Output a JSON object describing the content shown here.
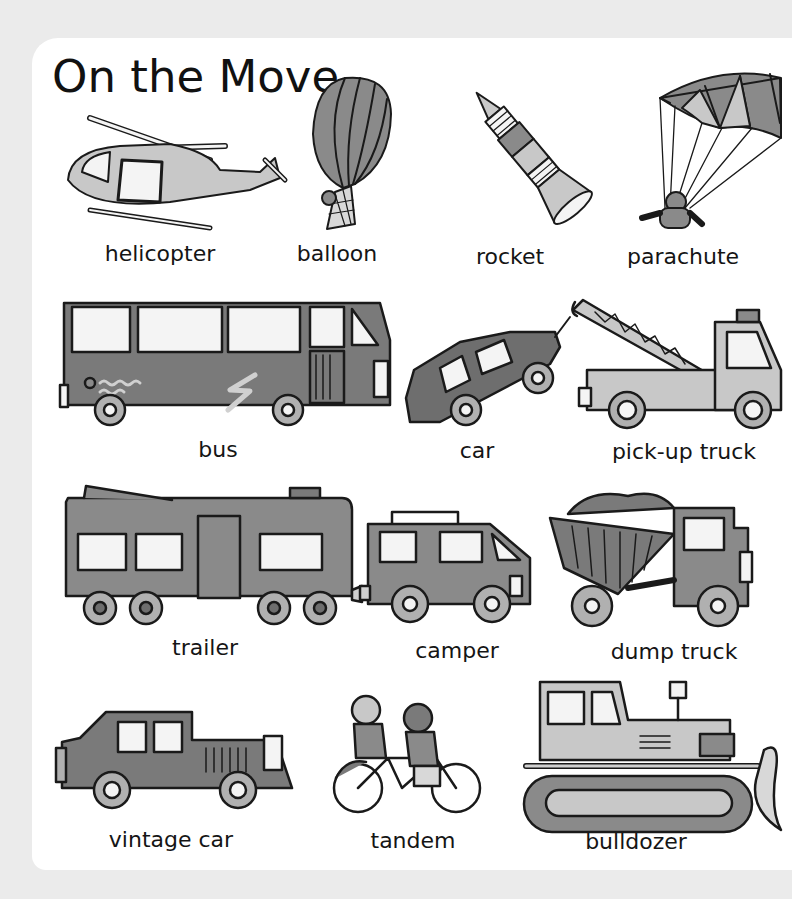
{
  "page": {
    "title": "On the Move"
  },
  "vehicles": [
    {
      "id": "helicopter",
      "label": "helicopter",
      "row": 1
    },
    {
      "id": "balloon",
      "label": "balloon",
      "row": 1
    },
    {
      "id": "rocket",
      "label": "rocket",
      "row": 1
    },
    {
      "id": "parachute",
      "label": "parachute",
      "row": 1
    },
    {
      "id": "bus",
      "label": "bus",
      "row": 2
    },
    {
      "id": "car",
      "label": "car",
      "row": 2
    },
    {
      "id": "pickup-truck",
      "label": "pick-up truck",
      "row": 2
    },
    {
      "id": "trailer",
      "label": "trailer",
      "row": 3
    },
    {
      "id": "camper",
      "label": "camper",
      "row": 3
    },
    {
      "id": "dump-truck",
      "label": "dump truck",
      "row": 3
    },
    {
      "id": "vintage-car",
      "label": "vintage car",
      "row": 4
    },
    {
      "id": "tandem",
      "label": "tandem",
      "row": 4
    },
    {
      "id": "bulldozer",
      "label": "bulldozer",
      "row": 4
    }
  ],
  "colors": {
    "background": "#ebebeb",
    "page": "#ffffff",
    "ink": "#1a1a1a",
    "dark_fill": "#7a7a7a",
    "mid_fill": "#9a9a9a",
    "light_fill": "#c8c8c8",
    "window": "#f4f4f4"
  }
}
